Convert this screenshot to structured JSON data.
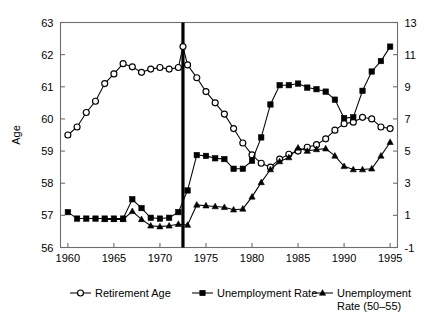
{
  "chart_data": {
    "type": "line",
    "title": "",
    "subtitle": "",
    "xlabel": "",
    "ylabel": "Age",
    "ylabel_right": "",
    "xlim": [
      1959.2,
      1995.8
    ],
    "ylim": [
      56,
      63
    ],
    "ylim_right": [
      -1,
      13
    ],
    "xticks": [
      1960,
      1965,
      1970,
      1975,
      1980,
      1985,
      1990,
      1995
    ],
    "xticklabels": [
      "1960",
      "1965",
      "1970",
      "1975",
      "1980",
      "1985",
      "1990",
      "1995"
    ],
    "yticks": [
      56,
      57,
      58,
      59,
      60,
      61,
      62,
      63
    ],
    "yticklabels": [
      "56",
      "57",
      "58",
      "59",
      "60",
      "61",
      "62",
      "63"
    ],
    "yticks_right": [
      -1,
      1,
      3,
      5,
      7,
      9,
      11,
      13
    ],
    "yticklabels_right": [
      "-1",
      "1",
      "3",
      "5",
      "7",
      "9",
      "11",
      "13"
    ],
    "grid": false,
    "legend_position": "bottom",
    "annotations": [
      {
        "name": "reform-vertical-line",
        "type": "vline",
        "x": 1972.5
      }
    ],
    "series": [
      {
        "name": "Retirement Age",
        "axis": "left",
        "marker": "open-circle",
        "x": [
          1960,
          1961,
          1962,
          1963,
          1964,
          1965,
          1966,
          1967,
          1968,
          1969,
          1970,
          1971,
          1972,
          1972.5,
          1973,
          1974,
          1975,
          1976,
          1977,
          1978,
          1979,
          1980,
          1981,
          1982,
          1983,
          1984,
          1985,
          1986,
          1987,
          1988,
          1989,
          1990,
          1991,
          1992,
          1993,
          1994,
          1995
        ],
        "values": [
          59.5,
          59.75,
          60.2,
          60.55,
          61.1,
          61.4,
          61.72,
          61.62,
          61.45,
          61.55,
          61.6,
          61.55,
          61.6,
          62.25,
          61.68,
          61.28,
          60.85,
          60.5,
          60.15,
          59.7,
          59.25,
          58.88,
          58.62,
          58.5,
          58.75,
          58.9,
          59.0,
          59.12,
          59.2,
          59.38,
          59.65,
          59.85,
          59.9,
          60.05,
          60.0,
          59.75,
          59.7
        ]
      },
      {
        "name": "Unemployment Rate",
        "axis": "right",
        "marker": "filled-square",
        "x": [
          1960,
          1961,
          1962,
          1963,
          1964,
          1965,
          1966,
          1967,
          1968,
          1969,
          1970,
          1971,
          1972,
          1973,
          1974,
          1975,
          1976,
          1977,
          1978,
          1979,
          1980,
          1981,
          1982,
          1983,
          1984,
          1985,
          1986,
          1987,
          1988,
          1989,
          1990,
          1991,
          1992,
          1993,
          1994,
          1995
        ],
        "values": [
          1.2,
          0.8,
          0.8,
          0.8,
          0.8,
          0.8,
          0.8,
          2.0,
          1.45,
          0.85,
          0.8,
          0.85,
          1.2,
          2.55,
          4.75,
          4.7,
          4.55,
          4.5,
          3.9,
          3.9,
          4.4,
          5.85,
          7.9,
          9.1,
          9.1,
          9.2,
          8.95,
          8.85,
          8.7,
          8.2,
          7.05,
          7.1,
          8.75,
          9.95,
          10.6,
          11.5
        ]
      },
      {
        "name": "Unemployment Rate (50–55)",
        "axis": "right",
        "marker": "filled-triangle",
        "x": [
          1964,
          1965,
          1966,
          1967,
          1968,
          1969,
          1970,
          1971,
          1972,
          1973,
          1974,
          1975,
          1976,
          1977,
          1978,
          1979,
          1980,
          1981,
          1982,
          1983,
          1984,
          1985,
          1986,
          1987,
          1988,
          1989,
          1990,
          1991,
          1992,
          1993,
          1994,
          1995
        ],
        "values": [
          0.75,
          0.75,
          0.75,
          1.25,
          0.75,
          0.35,
          0.3,
          0.35,
          0.45,
          0.4,
          1.65,
          1.6,
          1.55,
          1.5,
          1.35,
          1.4,
          2.15,
          3.05,
          3.85,
          4.35,
          4.6,
          5.2,
          5.0,
          5.1,
          5.15,
          4.7,
          4.05,
          3.85,
          3.85,
          3.9,
          4.7,
          5.55
        ]
      }
    ]
  },
  "legend": {
    "items": [
      {
        "label": "Retirement Age",
        "marker": "open-circle"
      },
      {
        "label": "Unemployment Rate",
        "marker": "filled-square"
      },
      {
        "label": "Unemployment",
        "label2": "Rate (50–55)",
        "marker": "filled-triangle"
      }
    ]
  },
  "colors": {
    "ink": "#000000",
    "frame": "#6e6e6e",
    "background": "#ffffff"
  }
}
